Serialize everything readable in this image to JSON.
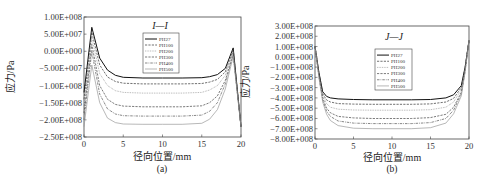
{
  "chart_data": [
    {
      "type": "line",
      "panel_label": "(a)",
      "title": "I—I",
      "xlabel": "径向位置/mm",
      "ylabel": "应力/Pa",
      "xlim": [
        0,
        20
      ],
      "ylim": [
        -250000000,
        100000000
      ],
      "xticks": [
        0,
        5,
        10,
        15,
        20
      ],
      "xtick_labels": [
        "0",
        "5",
        "10",
        "15",
        "20"
      ],
      "yticks": [
        100000000,
        50000000,
        0,
        -50000000,
        -100000000,
        -150000000,
        -200000000,
        -250000000
      ],
      "ytick_labels": [
        "1.00E+008",
        "5.00E+007",
        "0.00E+000",
        "-5.00E+007",
        "-1.00E+008",
        "-1.50E+008",
        "-2.00E+008",
        "-2.50E+008"
      ],
      "grid": false,
      "legend_position": "upper center",
      "x": [
        0,
        1,
        2,
        3,
        4,
        5,
        7.5,
        10,
        12.5,
        15,
        16,
        17,
        18,
        19,
        20
      ],
      "series": [
        {
          "name": "PH27",
          "style": "solid",
          "color": "#111111",
          "values": [
            -120000000,
            70000000,
            -20000000,
            -55000000,
            -70000000,
            -76000000,
            -78000000,
            -78000000,
            -78000000,
            -77000000,
            -74000000,
            -68000000,
            -50000000,
            10000000,
            -220000000
          ]
        },
        {
          "name": "PH100",
          "style": "dashed",
          "color": "#333333",
          "values": [
            -140000000,
            55000000,
            -40000000,
            -75000000,
            -88000000,
            -93000000,
            -95000000,
            -95000000,
            -95000000,
            -94000000,
            -90000000,
            -82000000,
            -60000000,
            5000000,
            -220000000
          ]
        },
        {
          "name": "PH200",
          "style": "dotted",
          "color": "#888888",
          "values": [
            -160000000,
            40000000,
            -65000000,
            -100000000,
            -115000000,
            -120000000,
            -122000000,
            -122000000,
            -122000000,
            -120000000,
            -113000000,
            -100000000,
            -70000000,
            0,
            -220000000
          ]
        },
        {
          "name": "PH300",
          "style": "dashed",
          "color": "#444444",
          "values": [
            -180000000,
            20000000,
            -100000000,
            -140000000,
            -155000000,
            -160000000,
            -162000000,
            -162000000,
            -162000000,
            -159000000,
            -150000000,
            -130000000,
            -85000000,
            -5000000,
            -220000000
          ]
        },
        {
          "name": "PH400",
          "style": "dashdot",
          "color": "#555555",
          "values": [
            -200000000,
            0,
            -125000000,
            -168000000,
            -183000000,
            -188000000,
            -189000000,
            -189000000,
            -189000000,
            -186000000,
            -175000000,
            -150000000,
            -95000000,
            -10000000,
            -220000000
          ]
        },
        {
          "name": "PH500",
          "style": "solid",
          "color": "#999999",
          "values": [
            -220000000,
            -40000000,
            -150000000,
            -195000000,
            -208000000,
            -212000000,
            -213000000,
            -213000000,
            -213000000,
            -210000000,
            -198000000,
            -170000000,
            -110000000,
            -15000000,
            -220000000
          ]
        }
      ]
    },
    {
      "type": "line",
      "panel_label": "(b)",
      "title": "J—J",
      "xlabel": "径向位置/mm",
      "ylabel": "应力/Pa",
      "xlim": [
        0,
        20
      ],
      "ylim": [
        -800000000,
        300000000
      ],
      "xticks": [
        0,
        5,
        10,
        15,
        20
      ],
      "xtick_labels": [
        "0",
        "5",
        "10",
        "15",
        "20"
      ],
      "yticks": [
        300000000,
        200000000,
        100000000,
        0,
        -100000000,
        -200000000,
        -300000000,
        -400000000,
        -500000000,
        -600000000,
        -700000000,
        -800000000
      ],
      "ytick_labels": [
        "3.00E+008",
        "2.00E+008",
        "1.00E+008",
        "0.00E+000",
        "-1.00E+008",
        "-2.00E+008",
        "-3.00E+008",
        "-4.00E+008",
        "-5.00E+008",
        "-6.00E+008",
        "-7.00E+008",
        "-8.00E+008"
      ],
      "grid": false,
      "legend_position": "upper center",
      "x": [
        0,
        0.5,
        1,
        1.5,
        2,
        3,
        5,
        7.5,
        10,
        12.5,
        15,
        17,
        18,
        19,
        19.5,
        20
      ],
      "series": [
        {
          "name": "PH27",
          "style": "solid",
          "color": "#111111",
          "values": [
            100000000,
            -150000000,
            -340000000,
            -385000000,
            -400000000,
            -410000000,
            -415000000,
            -418000000,
            -418000000,
            -418000000,
            -415000000,
            -400000000,
            -370000000,
            -280000000,
            -100000000,
            160000000
          ]
        },
        {
          "name": "PH100",
          "style": "dashed",
          "color": "#333333",
          "values": [
            100000000,
            -160000000,
            -360000000,
            -420000000,
            -440000000,
            -455000000,
            -460000000,
            -462000000,
            -462000000,
            -462000000,
            -458000000,
            -440000000,
            -405000000,
            -300000000,
            -110000000,
            160000000
          ]
        },
        {
          "name": "PH200",
          "style": "dotted",
          "color": "#888888",
          "values": [
            100000000,
            -170000000,
            -380000000,
            -455000000,
            -490000000,
            -510000000,
            -518000000,
            -520000000,
            -520000000,
            -520000000,
            -515000000,
            -490000000,
            -440000000,
            -320000000,
            -120000000,
            160000000
          ]
        },
        {
          "name": "PH300",
          "style": "dashed",
          "color": "#444444",
          "values": [
            100000000,
            -180000000,
            -400000000,
            -500000000,
            -545000000,
            -580000000,
            -595000000,
            -600000000,
            -600000000,
            -600000000,
            -592000000,
            -560000000,
            -490000000,
            -345000000,
            -130000000,
            160000000
          ]
        },
        {
          "name": "PH400",
          "style": "dashdot",
          "color": "#555555",
          "values": [
            100000000,
            -190000000,
            -420000000,
            -530000000,
            -580000000,
            -625000000,
            -645000000,
            -650000000,
            -650000000,
            -650000000,
            -640000000,
            -600000000,
            -520000000,
            -360000000,
            -140000000,
            160000000
          ]
        },
        {
          "name": "PH500",
          "style": "solid",
          "color": "#999999",
          "values": [
            100000000,
            -200000000,
            -440000000,
            -560000000,
            -620000000,
            -670000000,
            -695000000,
            -700000000,
            -700000000,
            -700000000,
            -690000000,
            -645000000,
            -555000000,
            -380000000,
            -150000000,
            160000000
          ]
        }
      ]
    }
  ],
  "panels": [
    {
      "frame": {
        "x": 84,
        "y": 17,
        "w": 157,
        "h": 120
      },
      "legend": {
        "x": 143,
        "y": 33,
        "w": 36,
        "h": 40
      },
      "title_pos": {
        "x": 160,
        "y": 29
      }
    },
    {
      "frame": {
        "x": 315,
        "y": 26,
        "w": 154,
        "h": 113
      },
      "legend": {
        "x": 375,
        "y": 49,
        "w": 37,
        "h": 41
      },
      "title_pos": {
        "x": 394,
        "y": 40
      }
    }
  ],
  "figure": {
    "caption_a": "(a)",
    "caption_b": "(b)",
    "xlabel_a": "径向位置/mm",
    "xlabel_b": "径向位置/mm",
    "ylabel_a": "应力/Pa",
    "ylabel_b": "应力/Pa",
    "title_a": "I—I",
    "title_b": "J—J"
  }
}
